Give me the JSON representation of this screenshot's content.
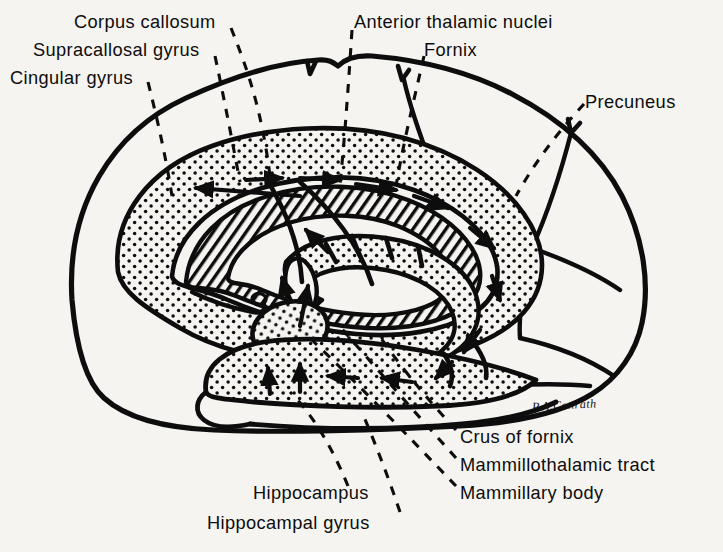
{
  "figure": {
    "signature": "P.A.Conrath",
    "background_color": "#f6f4f1",
    "ink_color": "#0d0d0d"
  },
  "labels": {
    "corpus_callosum": "Corpus callosum",
    "supracallosal_gyrus": "Supracallosal gyrus",
    "cingular_gyrus": "Cingular gyrus",
    "anterior_thalamic_nuclei": "Anterior thalamic nuclei",
    "fornix": "Fornix",
    "precuneus": "Precuneus",
    "crus_of_fornix": "Crus of fornix",
    "mammillothalamic_tract": "Mammillothalamic tract",
    "mammillary_body": "Mammillary body",
    "hippocampus": "Hippocampus",
    "hippocampal_gyrus": "Hippocampal gyrus"
  },
  "label_positions": {
    "corpus_callosum": {
      "x": 74,
      "y": 12
    },
    "supracallosal_gyrus": {
      "x": 33,
      "y": 40
    },
    "cingular_gyrus": {
      "x": 10,
      "y": 68
    },
    "anterior_thalamic_nuclei": {
      "x": 354,
      "y": 12
    },
    "fornix": {
      "x": 424,
      "y": 40
    },
    "precuneus": {
      "x": 585,
      "y": 92
    },
    "crus_of_fornix": {
      "x": 460,
      "y": 427
    },
    "mammillothalamic_tract": {
      "x": 460,
      "y": 455
    },
    "mammillary_body": {
      "x": 460,
      "y": 483
    },
    "hippocampus": {
      "x": 253,
      "y": 483
    },
    "hippocampal_gyrus": {
      "x": 207,
      "y": 513
    },
    "signature": {
      "x": 532,
      "y": 398
    }
  }
}
